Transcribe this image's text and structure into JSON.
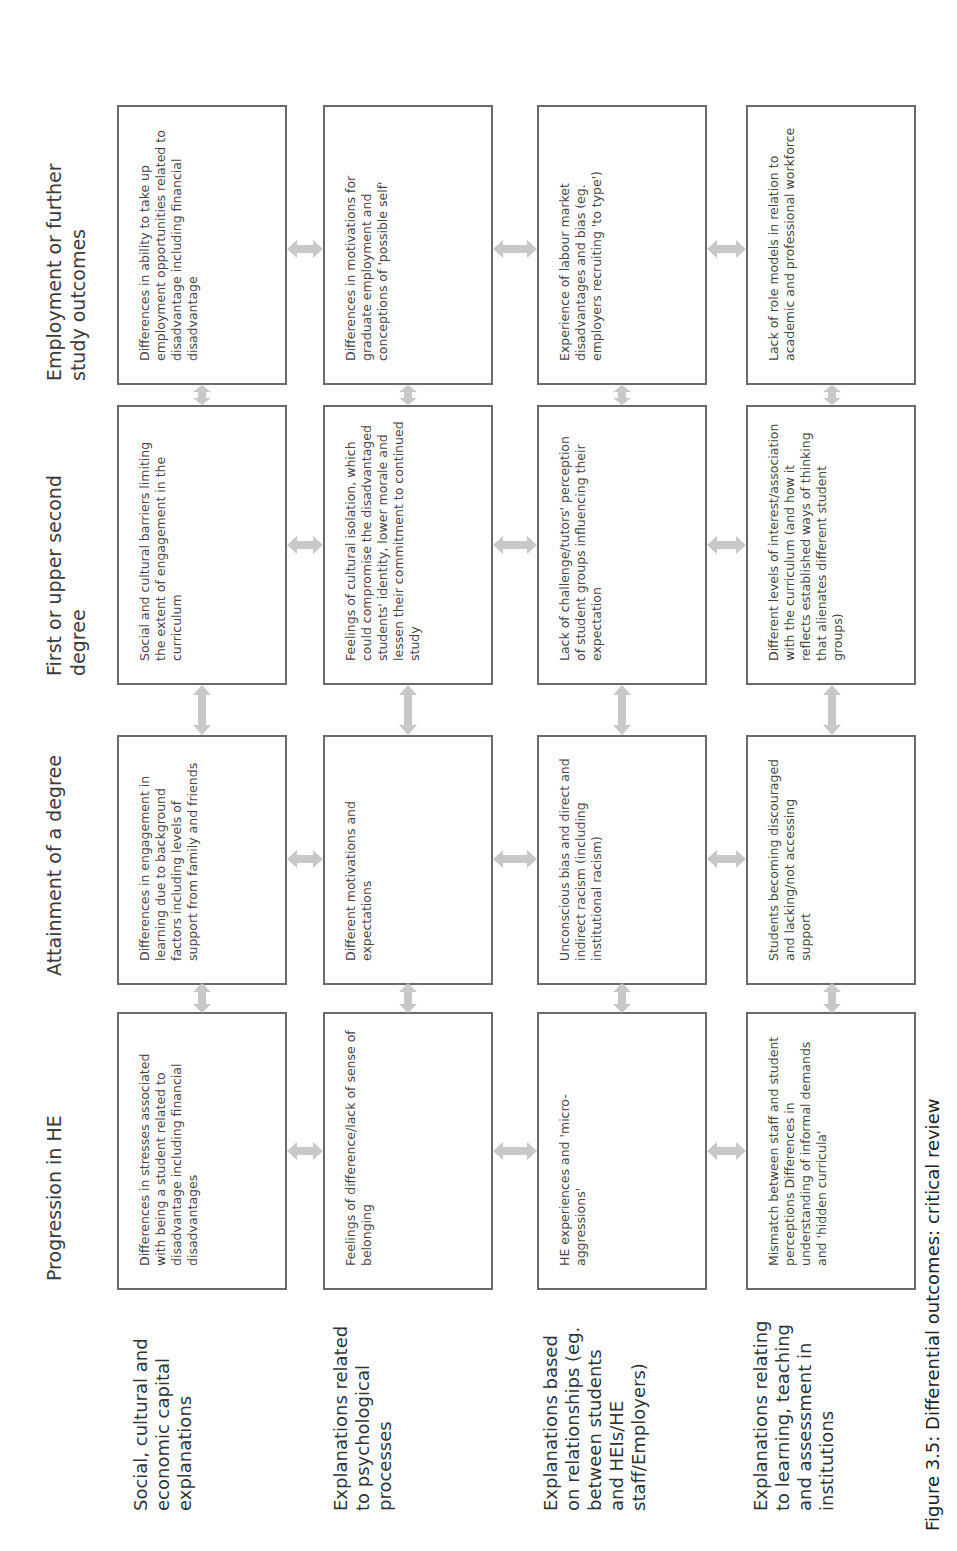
{
  "figure": {
    "caption": "Figure 3.5: Differential outcomes: critical review",
    "arrow_color": "#c8c8c8",
    "box_border_color": "#6a6a6a"
  },
  "columns": [
    {
      "label": "Progression in HE"
    },
    {
      "label": "Attainment of a degree"
    },
    {
      "label": "First or upper second degree"
    },
    {
      "label": "Employment or further study outcomes"
    }
  ],
  "rows": [
    {
      "label": "Social, cultural and economic capital explanations",
      "cells": [
        "Differences in stresses associated with being a student related to disadvantage including financial disadvantages",
        "Differences in engagement in learning due to background factors including levels of support from family and friends",
        "Social and cultural barriers limiting the extent of engagement in the curriculum",
        "Differences in ability to take up employment opportunities related to disadvantage including financial disadvantage"
      ]
    },
    {
      "label": "Explanations related to psychological processes",
      "cells": [
        "Feelings of difference/lack of sense of belonging",
        "Different motivations and expectations",
        "Feelings of cultural isolation, which could compromise the disadvantaged students' identity, lower morale and lessen their commitment to continued study",
        "Differences in motivations for graduate employment and conceptions of 'possible self'"
      ]
    },
    {
      "label": "Explanations based on relationships (eg. between students and HEIs/HE staff/Employers)",
      "cells": [
        "HE experiences and 'micro-aggressions'",
        "Unconscious bias and direct and indirect racism (including institutional racism)",
        "Lack of challenge/tutors' perception of student groups influencing their expectation",
        "Experience of labour market disadvantages and bias (eg. employers recruiting 'to type')"
      ]
    },
    {
      "label": "Explanations relating to learning, teaching and assessment in institutions",
      "cells": [
        "Mismatch between staff and student perceptions Differences in understanding of informal demands and 'hidden curricula'",
        "Students becoming discouraged and lacking/not accessing support",
        "Different levels of interest/association with the curriculum (and how it reflects established ways of thinking that alienates different student groups)",
        "Lack of role models in relation to academic and professional workforce"
      ]
    }
  ]
}
